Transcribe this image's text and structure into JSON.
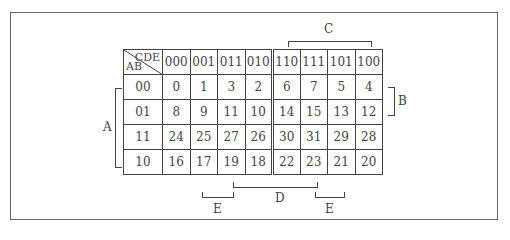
{
  "kmap": {
    "corner": {
      "col_var": "CDE",
      "row_var": "AB"
    },
    "col_headers": [
      "000",
      "001",
      "011",
      "010",
      "110",
      "111",
      "101",
      "100"
    ],
    "rows": [
      {
        "label": "00",
        "cells": [
          "0",
          "1",
          "3",
          "2",
          "6",
          "7",
          "5",
          "4"
        ]
      },
      {
        "label": "01",
        "cells": [
          "8",
          "9",
          "11",
          "10",
          "14",
          "15",
          "13",
          "12"
        ]
      },
      {
        "label": "11",
        "cells": [
          "24",
          "25",
          "27",
          "26",
          "30",
          "31",
          "29",
          "28"
        ]
      },
      {
        "label": "10",
        "cells": [
          "16",
          "17",
          "19",
          "18",
          "22",
          "23",
          "21",
          "20"
        ]
      }
    ]
  },
  "brackets": {
    "A": "A",
    "B": "B",
    "C": "C",
    "D": "D",
    "E_left": "E",
    "E_right": "E"
  }
}
